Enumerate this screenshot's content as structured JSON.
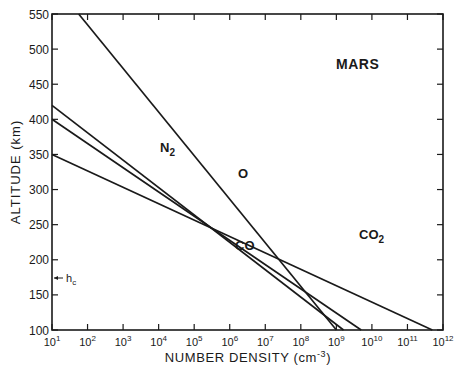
{
  "chart_data": {
    "type": "line",
    "title": "MARS",
    "xlabel": "NUMBER DENSITY (cm⁻³)",
    "ylabel": "ALTITUDE (km)",
    "xscale": "log",
    "xlim_exp": [
      1,
      12
    ],
    "ylim": [
      100,
      550
    ],
    "x_ticks": [
      "10¹",
      "10²",
      "10³",
      "10⁴",
      "10⁵",
      "10⁶",
      "10⁷",
      "10⁸",
      "10⁹",
      "10¹⁰",
      "10¹¹",
      "10¹²"
    ],
    "y_ticks": [
      100,
      150,
      200,
      250,
      300,
      350,
      400,
      450,
      500,
      550
    ],
    "grid": false,
    "annotations": [
      {
        "text": "h",
        "sub": "c",
        "altitude": 175,
        "arrow": "left"
      }
    ],
    "series": [
      {
        "name": "O",
        "label": "O",
        "points_log10x": [
          [
            1.75,
            550
          ],
          [
            9.0,
            100
          ]
        ]
      },
      {
        "name": "N2",
        "label": "N",
        "sub": "2",
        "points_log10x": [
          [
            1.0,
            420
          ],
          [
            9.2,
            100
          ]
        ]
      },
      {
        "name": "CO",
        "label": "CO",
        "points_log10x": [
          [
            1.0,
            400
          ],
          [
            9.7,
            100
          ]
        ]
      },
      {
        "name": "CO2",
        "label": "CO",
        "sub": "2",
        "points_log10x": [
          [
            1.0,
            350
          ],
          [
            11.7,
            100
          ]
        ]
      }
    ]
  },
  "labels": {
    "title": "MARS",
    "ylabel": "ALTITUDE (km)",
    "xlabel_main": "NUMBER DENSITY (cm",
    "xlabel_exp": "-3",
    "xlabel_close": ")",
    "hc_main": "h",
    "hc_sub": "c"
  }
}
